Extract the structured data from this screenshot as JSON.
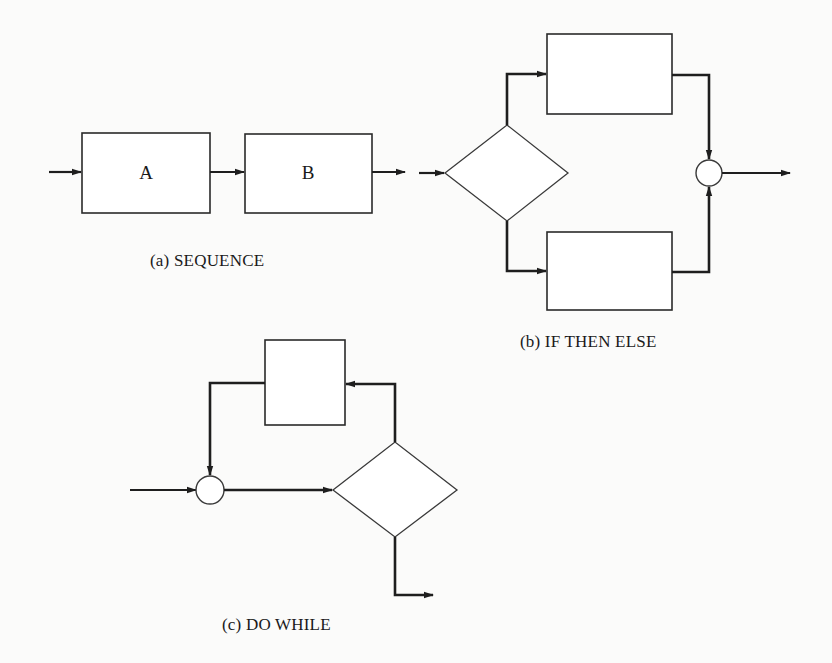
{
  "figure": {
    "panels": [
      {
        "id": "a",
        "caption": "(a) SEQUENCE",
        "blocks": [
          {
            "label": "A"
          },
          {
            "label": "B"
          }
        ]
      },
      {
        "id": "b",
        "caption": "(b) IF THEN ELSE",
        "elements": [
          "decision",
          "then-block",
          "else-block",
          "join"
        ]
      },
      {
        "id": "c",
        "caption": "(c) DO WHILE",
        "elements": [
          "join",
          "decision",
          "loop-body-block"
        ]
      }
    ]
  },
  "colors": {
    "background": "#fbfbfa",
    "stroke": "#1e1e1e"
  }
}
